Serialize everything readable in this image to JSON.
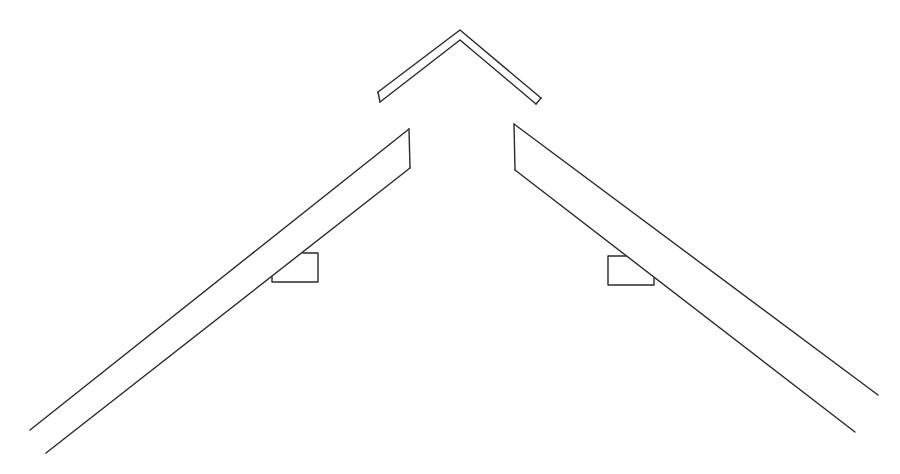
{
  "diagram": {
    "type": "roof-framing-sketch",
    "stroke_color": "#2a2a2a",
    "background": "#ffffff",
    "parts": {
      "ridge_cap": {
        "outer": [
          [
            378,
            92
          ],
          [
            460,
            30
          ],
          [
            541,
            98
          ]
        ],
        "inner": [
          [
            380,
            102
          ],
          [
            460,
            40
          ],
          [
            536,
            104
          ]
        ],
        "ends": [
          [
            [
              378,
              92
            ],
            [
              380,
              102
            ]
          ],
          [
            [
              541,
              98
            ],
            [
              536,
              104
            ]
          ]
        ]
      },
      "left_rafter": {
        "upper": [
          [
            409,
            129
          ],
          [
            30,
            430
          ]
        ],
        "lower": [
          [
            410,
            168
          ],
          [
            46,
            453
          ]
        ],
        "top_cut": [
          [
            409,
            129
          ],
          [
            410,
            168
          ]
        ]
      },
      "right_rafter": {
        "upper": [
          [
            514,
            124
          ],
          [
            878,
            395
          ]
        ],
        "lower": [
          [
            515,
            170
          ],
          [
            855,
            432
          ]
        ],
        "top_cut": [
          [
            514,
            124
          ],
          [
            515,
            170
          ]
        ]
      },
      "left_block": [
        [
          303,
          253
        ],
        [
          318,
          253
        ],
        [
          318,
          282
        ],
        [
          272,
          282
        ],
        [
          272,
          277
        ]
      ],
      "right_block": [
        [
          626,
          256
        ],
        [
          608,
          256
        ],
        [
          608,
          285
        ],
        [
          654,
          285
        ],
        [
          654,
          278
        ]
      ]
    }
  }
}
